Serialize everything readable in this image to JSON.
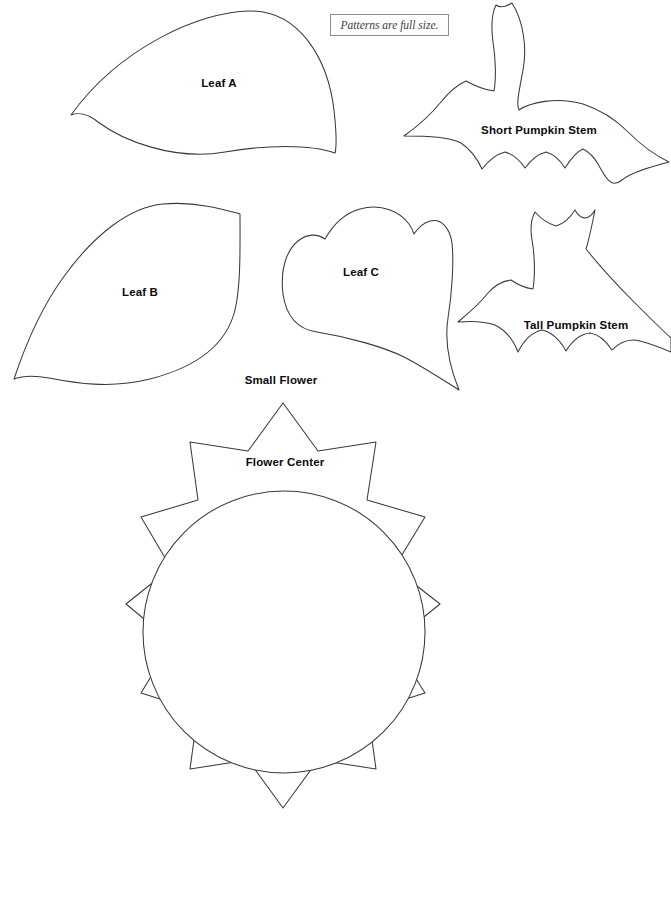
{
  "document": {
    "title": "Pumpkin and Flower Appliqué Pattern Sheet",
    "background_color": "#ffffff",
    "outline_color": "#3a3a3c",
    "label_color": "#0b0b0d"
  },
  "note": {
    "text": "Patterns are full size.",
    "border_color": "#8d8d90"
  },
  "pieces": [
    {
      "id": "leaf-a",
      "label": "Leaf A",
      "label_x": 219,
      "label_y": 84,
      "path": "M 71 115 C 120 47 200 12 249 11 C 300 10 328 60 334 110 C 337 137 336 149 335 153 C 310 144 265 145 225 152 C 173 161 122 140 98 122 C 88 114 78 112 71 115 Z"
    },
    {
      "id": "short-pumpkin-stem",
      "label": "Short Pumpkin Stem",
      "label_x": 539,
      "label_y": 131,
      "path": "M 512 3 C 524 22 527 49 523 70 C 519 92 516 104 519 110 C 529 103 556 96 583 104 C 601 110 614 118 627 131 C 640 144 654 155 669 162 C 655 166 633 171 622 180 C 611 189 606 178 598 164 C 594 157 589 152 583 149 C 576 152 570 160 565 168 C 560 160 553 154 546 152 C 538 154 531 160 525 168 C 519 159 512 154 505 152 C 497 154 489 160 482 169 C 477 158 470 149 461 143 C 449 137 430 136 404 136 C 418 126 432 113 441 102 C 449 92 457 85 466 81 C 475 86 485 90 494 91 C 496 80 496 60 493 42 C 491 27 492 13 496 5 C 501 9 507 6 512 3 Z"
    },
    {
      "id": "leaf-b",
      "label": "Leaf B",
      "label_x": 140,
      "label_y": 293,
      "path": "M 14 379 C 25 346 42 306 65 275 C 95 234 130 207 163 204 C 196 201 226 210 240 214 C 240 245 241 285 235 310 C 226 347 193 368 150 379 C 110 389 75 383 49 378 C 33 375 22 376 14 379 Z"
    },
    {
      "id": "leaf-c",
      "label": "Leaf C",
      "label_x": 361,
      "label_y": 273,
      "path": "M 325 239 C 333 225 345 213 360 209 C 382 203 400 212 409 224 C 412 228 413 231 414 234 C 418 228 423 223 430 221 C 442 218 450 229 452 243 C 454 262 452 293 448 318 C 444 344 450 368 459 390 C 440 378 420 365 404 357 C 384 347 348 337 317 332 C 296 329 286 315 283 294 C 280 270 286 251 298 241 C 308 233 318 234 325 239 Z"
    },
    {
      "id": "tall-pumpkin-stem",
      "label": "Tall Pumpkin Stem",
      "label_x": 576,
      "label_y": 326,
      "path": "M 595 210 C 592 225 589 240 586 249 C 598 264 616 284 634 302 C 650 318 662 330 671 338 L 671 352 C 664 349 651 344 640 341 C 629 338 620 342 612 350 C 606 341 598 334 590 333 C 581 334 572 341 566 351 C 560 340 551 332 542 330 C 533 332 524 340 518 352 C 513 339 505 330 495 325 C 484 321 470 321 458 322 C 470 312 481 302 488 293 C 495 285 503 281 511 280 C 518 285 526 288 533 289 C 535 277 535 256 532 240 C 530 228 531 219 535 212 C 541 219 549 224 556 226 C 563 224 570 218 575 210 C 580 219 588 222 595 210 Z"
    },
    {
      "id": "large-flower",
      "label": "Large Flower",
      "label_x": 280,
      "label_y": 381,
      "path": "M 283 331 L 322 385 L 388 374 L 378 441 L 443 460 L 408 517 L 460 558 L 406 601 L 443 659 L 379 679 L 388 745 L 322 735 L 283 789 L 243 735 L 177 745 L 187 679 L 122 659 L 158 601 L 105 558 L 157 517 L 122 460 L 187 441 L 177 374 L 243 385 Z"
    },
    {
      "id": "small-flower",
      "label": "Small Flower",
      "label_x": 281,
      "label_y": 463,
      "path": "M 283 403 L 318 451 L 376 442 L 367 500 L 425 517 L 394 568 L 440 604 L 393 642 L 425 693 L 368 711 L 376 769 L 318 760 L 283 808 L 248 760 L 190 769 L 198 711 L 141 693 L 172 642 L 126 604 L 171 568 L 141 517 L 198 500 L 190 442 L 248 451 Z"
    },
    {
      "id": "flower-center",
      "label": "Flower Center",
      "label_x": 285,
      "label_y": 633,
      "shape": "circle",
      "cx": 284,
      "cy": 632,
      "r": 141
    }
  ]
}
